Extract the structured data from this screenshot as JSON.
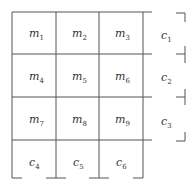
{
  "diagram": {
    "cells": [
      {
        "base": "m",
        "sub": "1"
      },
      {
        "base": "m",
        "sub": "2"
      },
      {
        "base": "m",
        "sub": "3"
      },
      {
        "base": "c",
        "sub": "1"
      },
      {
        "base": "m",
        "sub": "4"
      },
      {
        "base": "m",
        "sub": "5"
      },
      {
        "base": "m",
        "sub": "6"
      },
      {
        "base": "c",
        "sub": "2"
      },
      {
        "base": "m",
        "sub": "7"
      },
      {
        "base": "m",
        "sub": "8"
      },
      {
        "base": "m",
        "sub": "9"
      },
      {
        "base": "c",
        "sub": "3"
      },
      {
        "base": "c",
        "sub": "4"
      },
      {
        "base": "c",
        "sub": "5"
      },
      {
        "base": "c",
        "sub": "6"
      }
    ],
    "line_color": "#555555",
    "text_color": "#333333"
  }
}
